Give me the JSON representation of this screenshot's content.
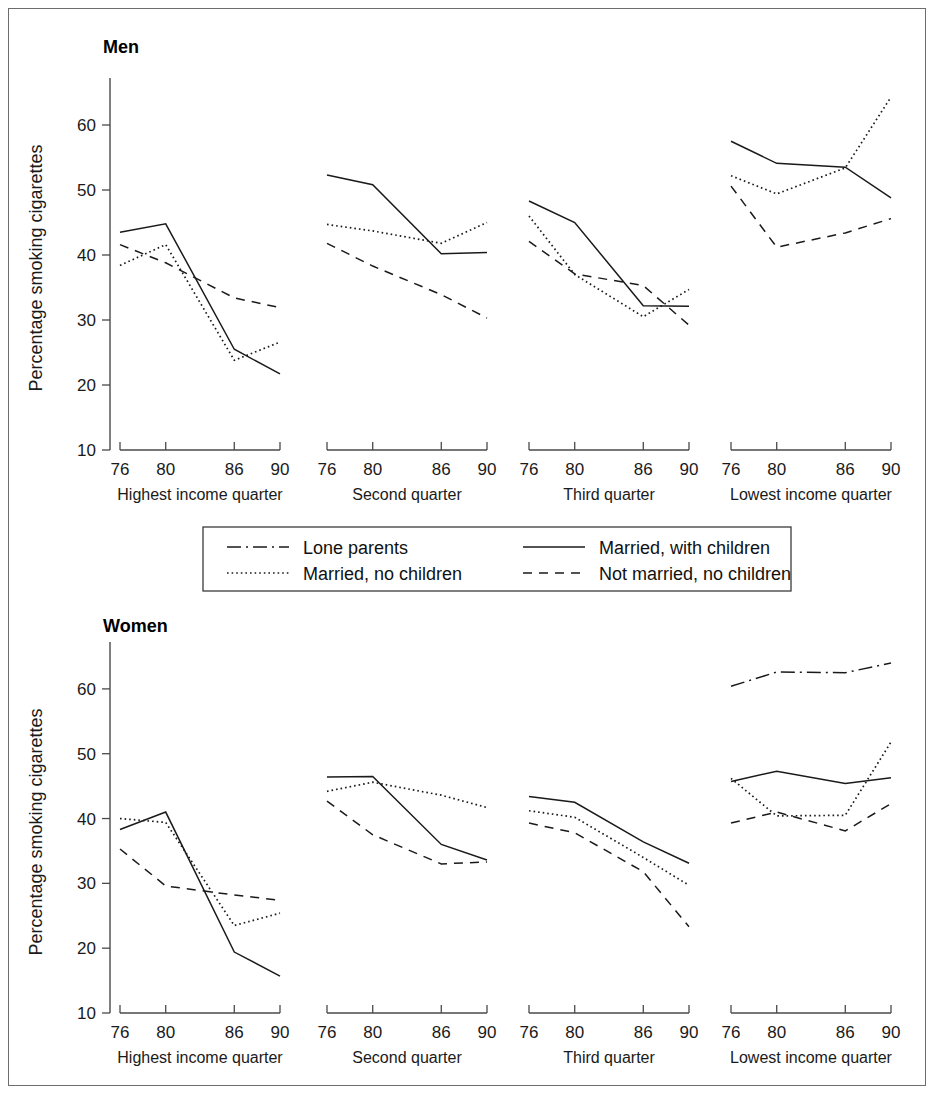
{
  "figure": {
    "width": 936,
    "height": 1096,
    "background": "#ffffff",
    "frame_color": "#6d6d6d",
    "line_color": "#1a1a1a"
  },
  "groups": [
    {
      "key": "men",
      "title": "Men"
    },
    {
      "key": "women",
      "title": "Women"
    }
  ],
  "axis": {
    "ylabel": "Percentage smoking cigarettes",
    "yticks": [
      10,
      20,
      30,
      40,
      50,
      60
    ],
    "ylim": [
      10,
      66
    ],
    "xticks": [
      76,
      80,
      86,
      90
    ],
    "xticklabels": [
      "76",
      "80",
      "86",
      "90"
    ],
    "xlim": [
      76,
      90
    ]
  },
  "panels": [
    {
      "key": "highest",
      "label": "Highest income quarter"
    },
    {
      "key": "second",
      "label": "Second quarter"
    },
    {
      "key": "third",
      "label": "Third quarter"
    },
    {
      "key": "lowest",
      "label": "Lowest income quarter"
    }
  ],
  "legend": {
    "entries": [
      {
        "label": "Lone parents",
        "style": "dashdot",
        "name": "legend-lone-parents"
      },
      {
        "label": "Married, with children",
        "style": "solid",
        "name": "legend-married-with-children"
      },
      {
        "label": "Married, no children",
        "style": "dotted",
        "name": "legend-married-no-children"
      },
      {
        "label": "Not married, no children",
        "style": "dashed",
        "name": "legend-not-married-no-children"
      }
    ]
  },
  "chart_data": {
    "type": "line",
    "xlabel": "Year",
    "ylabel": "Percentage smoking cigarettes",
    "x": [
      76,
      80,
      86,
      90
    ],
    "xticklabels": [
      "76",
      "80",
      "86",
      "90"
    ],
    "ylim": [
      10,
      66
    ],
    "yticks": [
      10,
      20,
      30,
      40,
      50,
      60
    ],
    "grid": false,
    "legend_position": "center, between the Men and Women charts",
    "series_styles": {
      "Lone parents": "dashdot",
      "Married, with children": "solid",
      "Married, no children": "dotted",
      "Not married, no children": "dashed"
    },
    "facets": [
      {
        "group": "Men",
        "panels": [
          {
            "panel": "Highest income quarter",
            "series": [
              {
                "name": "Married, with children",
                "style": "solid",
                "values": [
                  43.5,
                  44.8,
                  25.5,
                  21.7
                ]
              },
              {
                "name": "Married, no children",
                "style": "dotted",
                "values": [
                  38.4,
                  41.6,
                  23.8,
                  26.6
                ]
              },
              {
                "name": "Not married, no children",
                "style": "dashed",
                "values": [
                  41.6,
                  38.8,
                  33.4,
                  31.9
                ]
              }
            ]
          },
          {
            "panel": "Second quarter",
            "series": [
              {
                "name": "Married, with children",
                "style": "solid",
                "values": [
                  52.3,
                  50.8,
                  40.2,
                  40.4
                ]
              },
              {
                "name": "Married, no children",
                "style": "dotted",
                "values": [
                  44.7,
                  43.7,
                  41.8,
                  45.0
                ]
              },
              {
                "name": "Not married, no children",
                "style": "dashed",
                "values": [
                  41.8,
                  38.3,
                  33.9,
                  30.3
                ]
              }
            ]
          },
          {
            "panel": "Third quarter",
            "series": [
              {
                "name": "Married, with children",
                "style": "solid",
                "values": [
                  48.3,
                  45.0,
                  32.2,
                  32.1
                ]
              },
              {
                "name": "Married, no children",
                "style": "dotted",
                "values": [
                  46.0,
                  37.0,
                  30.5,
                  34.7
                ]
              },
              {
                "name": "Not married, no children",
                "style": "dashed",
                "values": [
                  42.1,
                  37.1,
                  35.3,
                  29.2
                ]
              }
            ]
          },
          {
            "panel": "Lowest income quarter",
            "series": [
              {
                "name": "Married, with children",
                "style": "solid",
                "values": [
                  57.5,
                  54.1,
                  53.5,
                  48.8
                ]
              },
              {
                "name": "Married, no children",
                "style": "dotted",
                "values": [
                  52.2,
                  49.4,
                  53.4,
                  64.3
                ]
              },
              {
                "name": "Not married, no children",
                "style": "dashed",
                "values": [
                  50.6,
                  41.2,
                  43.4,
                  45.6
                ]
              }
            ]
          }
        ]
      },
      {
        "group": "Women",
        "panels": [
          {
            "panel": "Highest income quarter",
            "series": [
              {
                "name": "Married, with children",
                "style": "solid",
                "values": [
                  38.3,
                  41.0,
                  19.4,
                  15.7
                ]
              },
              {
                "name": "Married, no children",
                "style": "dotted",
                "values": [
                  40.0,
                  39.4,
                  23.5,
                  25.4
                ]
              },
              {
                "name": "Not married, no children",
                "style": "dashed",
                "values": [
                  35.3,
                  29.6,
                  28.2,
                  27.4
                ]
              }
            ]
          },
          {
            "panel": "Second quarter",
            "series": [
              {
                "name": "Married, with children",
                "style": "solid",
                "values": [
                  46.4,
                  46.5,
                  36.0,
                  33.6
                ]
              },
              {
                "name": "Married, no children",
                "style": "dotted",
                "values": [
                  44.2,
                  45.6,
                  43.6,
                  41.7
                ]
              },
              {
                "name": "Not married, no children",
                "style": "dashed",
                "values": [
                  42.7,
                  37.5,
                  33.0,
                  33.3
                ]
              }
            ]
          },
          {
            "panel": "Third quarter",
            "series": [
              {
                "name": "Married, with children",
                "style": "solid",
                "values": [
                  43.4,
                  42.5,
                  36.4,
                  33.1
                ]
              },
              {
                "name": "Married, no children",
                "style": "dotted",
                "values": [
                  41.2,
                  40.2,
                  34.0,
                  29.7
                ]
              },
              {
                "name": "Not married, no children",
                "style": "dashed",
                "values": [
                  39.3,
                  37.8,
                  31.8,
                  23.3
                ]
              }
            ]
          },
          {
            "panel": "Lowest income quarter",
            "series": [
              {
                "name": "Lone parents",
                "style": "dashdot",
                "values": [
                  60.4,
                  62.6,
                  62.5,
                  64.0
                ]
              },
              {
                "name": "Married, with children",
                "style": "solid",
                "values": [
                  45.7,
                  47.3,
                  45.4,
                  46.3
                ]
              },
              {
                "name": "Married, no children",
                "style": "dotted",
                "values": [
                  46.2,
                  40.4,
                  40.5,
                  51.8
                ]
              },
              {
                "name": "Not married, no children",
                "style": "dashed",
                "values": [
                  39.3,
                  41.0,
                  38.1,
                  42.3
                ]
              }
            ]
          }
        ]
      }
    ]
  }
}
